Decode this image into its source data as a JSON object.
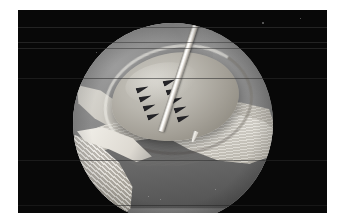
{
  "figure": {
    "modality": "arthroscopy",
    "view": "circular endoscope field of view",
    "palette": "grayscale",
    "background_color": "#ffffff",
    "panel_color": "#080808",
    "scope_field_color": "#9a9a9a",
    "instrument_color": "#ffffff",
    "suture_color": "#16161a"
  },
  "panel": {
    "x": 18,
    "y": 10,
    "width": 309,
    "height": 203,
    "label": "film panel"
  },
  "scope": {
    "center_x": 173,
    "center_y": 113,
    "radius": 100,
    "label": "circular endoscopic viewport"
  },
  "scanlines": [
    {
      "y": 27,
      "height": 1,
      "color": "#3a3a3a"
    },
    {
      "y": 42,
      "height": 1,
      "color": "#3a3a3a"
    },
    {
      "y": 48,
      "height": 1,
      "color": "#3a3a3a"
    },
    {
      "y": 78,
      "height": 1,
      "color": "#2c2c2c"
    },
    {
      "y": 160,
      "height": 1,
      "color": "#2c2c2c"
    },
    {
      "y": 205,
      "height": 1,
      "color": "#242424"
    }
  ],
  "anatomy": [
    {
      "name": "central-mound",
      "label": "Central tissue mound (lesion site)"
    },
    {
      "name": "capsule-sheet",
      "label": "Pale capsular sheet"
    },
    {
      "name": "fibrous-band-right",
      "label": "Striated fibrous band, right"
    },
    {
      "name": "fibrous-layers-left",
      "label": "Layered fibrous structure, lower left"
    },
    {
      "name": "dark-tissue-band",
      "label": "Dark tissue plane beneath mound"
    },
    {
      "name": "capsule-fold-left",
      "label": "Capsular fold, upper left"
    }
  ],
  "instrument": {
    "name": "needle-probe",
    "label": "Needle / probe",
    "angle_deg": 18,
    "entry_x": 139,
    "entry_y": 23,
    "tip_x": 173,
    "tip_y": 121
  },
  "sutures": {
    "label": "Suture anchor marks",
    "total": 9,
    "left_column": [
      {
        "x": 136,
        "y": 76,
        "rotation": -18
      },
      {
        "x": 139,
        "y": 85,
        "rotation": -18
      },
      {
        "x": 143,
        "y": 94,
        "rotation": -18
      },
      {
        "x": 147,
        "y": 103,
        "rotation": -18
      }
    ],
    "right_column": [
      {
        "x": 163,
        "y": 69,
        "rotation": -18
      },
      {
        "x": 166,
        "y": 78,
        "rotation": -18
      },
      {
        "x": 170,
        "y": 87,
        "rotation": -18
      },
      {
        "x": 174,
        "y": 96,
        "rotation": -18
      },
      {
        "x": 177,
        "y": 105,
        "rotation": -18
      }
    ]
  },
  "flecks": [
    {
      "x": 262,
      "y": 22,
      "size": 2
    },
    {
      "x": 300,
      "y": 18,
      "size": 1
    },
    {
      "x": 96,
      "y": 52,
      "size": 1
    },
    {
      "x": 148,
      "y": 196,
      "size": 1
    },
    {
      "x": 160,
      "y": 199,
      "size": 1
    },
    {
      "x": 215,
      "y": 189,
      "size": 1
    }
  ]
}
